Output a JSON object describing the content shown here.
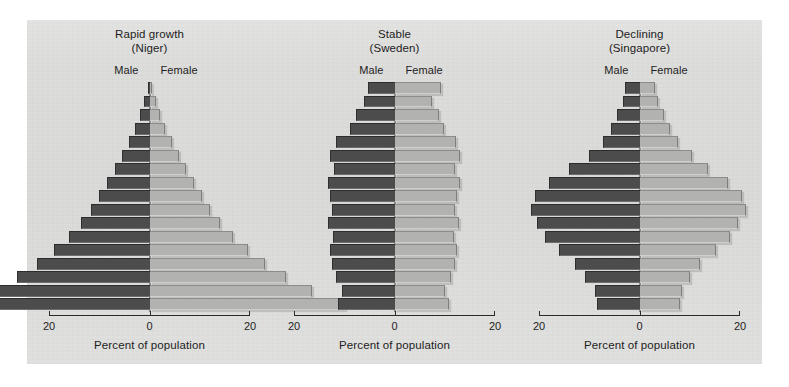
{
  "figure": {
    "background_color": "#dcdcda",
    "male_color": "#4c4c4c",
    "female_color": "#b2b2b0"
  },
  "panels": [
    {
      "title": "Rapid growth",
      "subtitle": "(Niger)",
      "male_label": "Male",
      "female_label": "Female",
      "axis_title": "Percent of population",
      "tick_left": "20",
      "tick_center": "0",
      "tick_right": "20"
    },
    {
      "title": "Stable",
      "subtitle": "(Sweden)",
      "male_label": "Male",
      "female_label": "Female",
      "axis_title": "Percent of population",
      "tick_left": "20",
      "tick_center": "0",
      "tick_right": "20"
    },
    {
      "title": "Declining",
      "subtitle": "(Singapore)",
      "male_label": "Male",
      "female_label": "Female",
      "axis_title": "Percent of population",
      "tick_left": "20",
      "tick_center": "0",
      "tick_right": "20"
    }
  ],
  "chart_data": [
    {
      "type": "bar",
      "subtype": "population-pyramid",
      "title": "Rapid growth (Niger)",
      "xlabel": "Percent of population",
      "ylabel": "",
      "xlim": [
        -20,
        20
      ],
      "xticks": [
        -20,
        0,
        20
      ],
      "xticklabels": [
        "20",
        "0",
        "20"
      ],
      "grid": false,
      "legend_position": "inline-top",
      "categories": [
        "0-4",
        "5-9",
        "10-14",
        "15-19",
        "20-24",
        "25-29",
        "30-34",
        "35-39",
        "40-44",
        "45-49",
        "50-54",
        "55-59",
        "60-64",
        "65-69",
        "70-74",
        "75-79",
        "80+"
      ],
      "order": "oldest-at-top",
      "series": [
        {
          "name": "Male",
          "direction": "left",
          "values": [
            19.0,
            15.8,
            13.2,
            11.2,
            9.5,
            8.0,
            6.8,
            5.8,
            5.0,
            4.2,
            3.4,
            2.7,
            2.0,
            1.4,
            0.9,
            0.5,
            0.2
          ]
        },
        {
          "name": "Female",
          "direction": "right",
          "values": [
            19.5,
            16.2,
            13.6,
            11.5,
            9.8,
            8.3,
            7.0,
            6.0,
            5.2,
            4.4,
            3.6,
            2.9,
            2.2,
            1.5,
            1.0,
            0.6,
            0.25
          ]
        }
      ]
    },
    {
      "type": "bar",
      "subtype": "population-pyramid",
      "title": "Stable (Sweden)",
      "xlabel": "Percent of population",
      "ylabel": "",
      "xlim": [
        -20,
        20
      ],
      "xticks": [
        -20,
        0,
        20
      ],
      "xticklabels": [
        "20",
        "0",
        "20"
      ],
      "grid": false,
      "legend_position": "inline-top",
      "categories": [
        "0-4",
        "5-9",
        "10-14",
        "15-19",
        "20-24",
        "25-29",
        "30-34",
        "35-39",
        "40-44",
        "45-49",
        "50-54",
        "55-59",
        "60-64",
        "65-69",
        "70-74",
        "75-79",
        "80+"
      ],
      "order": "oldest-at-top",
      "series": [
        {
          "name": "Male",
          "direction": "left",
          "values": [
            5.6,
            5.2,
            5.8,
            6.2,
            6.4,
            6.1,
            6.6,
            6.2,
            6.4,
            6.6,
            6.0,
            6.4,
            5.8,
            4.4,
            3.8,
            3.0,
            2.6
          ]
        },
        {
          "name": "Female",
          "direction": "right",
          "values": [
            5.4,
            5.0,
            5.6,
            6.0,
            6.2,
            5.9,
            6.4,
            6.0,
            6.2,
            6.5,
            6.0,
            6.5,
            6.1,
            4.9,
            4.4,
            3.7,
            4.6
          ]
        }
      ]
    },
    {
      "type": "bar",
      "subtype": "population-pyramid",
      "title": "Declining (Singapore)",
      "xlabel": "Percent of population",
      "ylabel": "",
      "xlim": [
        -20,
        20
      ],
      "xticks": [
        -20,
        0,
        20
      ],
      "xticklabels": [
        "20",
        "0",
        "20"
      ],
      "grid": false,
      "legend_position": "inline-top",
      "categories": [
        "0-4",
        "5-9",
        "10-14",
        "15-19",
        "20-24",
        "25-29",
        "30-34",
        "35-39",
        "40-44",
        "45-49",
        "50-54",
        "55-59",
        "60-64",
        "65-69",
        "70-74",
        "75-79",
        "80+"
      ],
      "order": "oldest-at-top",
      "series": [
        {
          "name": "Male",
          "direction": "left",
          "values": [
            4.2,
            4.4,
            5.4,
            6.4,
            8.0,
            9.4,
            10.2,
            10.8,
            10.4,
            9.0,
            7.0,
            5.0,
            3.6,
            2.8,
            2.2,
            1.6,
            1.4
          ]
        },
        {
          "name": "Female",
          "direction": "right",
          "values": [
            4.0,
            4.2,
            5.0,
            6.0,
            7.6,
            9.0,
            9.8,
            10.6,
            10.2,
            8.8,
            6.8,
            5.2,
            3.8,
            3.0,
            2.4,
            1.8,
            1.5
          ]
        }
      ]
    }
  ]
}
